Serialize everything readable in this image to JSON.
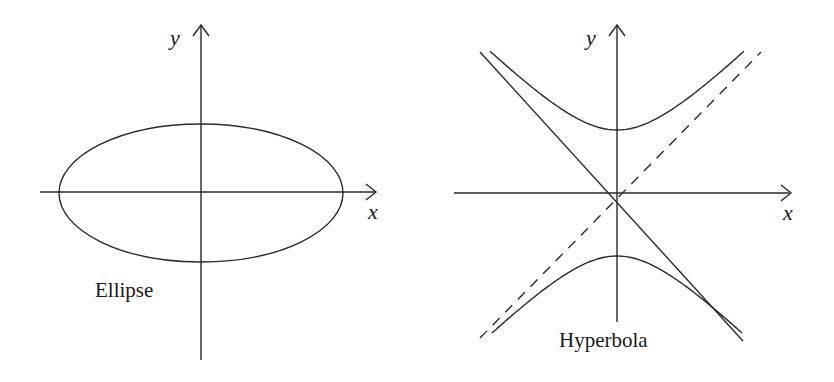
{
  "figures": [
    {
      "name": "ellipse",
      "caption": "Ellipse",
      "x_axis_label": "x",
      "y_axis_label": "y",
      "curve_type": "ellipse",
      "semi_major_axis_ratio": 2.06
    },
    {
      "name": "hyperbola",
      "caption": "Hyperbola",
      "x_axis_label": "x",
      "y_axis_label": "y",
      "curve_type": "hyperbola",
      "orientation": "vertical",
      "asymptotes": [
        {
          "style": "solid",
          "slope": -1
        },
        {
          "style": "dashed",
          "slope": 1
        }
      ]
    }
  ],
  "colors": {
    "line": "#2a2a2a",
    "text": "#1a1a1a",
    "background": "#ffffff"
  }
}
